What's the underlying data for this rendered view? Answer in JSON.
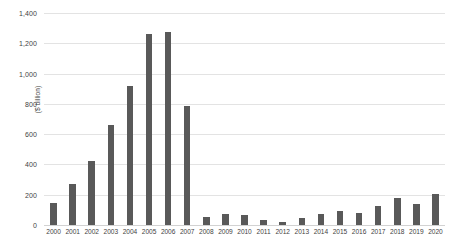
{
  "chart_data": {
    "type": "bar",
    "title": "",
    "subtitle": "",
    "xlabel": "",
    "ylabel": "($ billion)",
    "ylim": [
      0,
      1400
    ],
    "ytick_step": 200,
    "grid": true,
    "legend": false,
    "legend_position": "none",
    "bar_color": "#595959",
    "gridline_color": "#e3e3e3",
    "background_color": "#ffffff",
    "categories": [
      "2000",
      "2001",
      "2002",
      "2003",
      "2004",
      "2005",
      "2006",
      "2007",
      "2008",
      "2009",
      "2010",
      "2011",
      "2012",
      "2013",
      "2014",
      "2015",
      "2016",
      "2017",
      "2018",
      "2019",
      "2020"
    ],
    "values": [
      148,
      268,
      420,
      660,
      915,
      1260,
      1275,
      787,
      52,
      70,
      65,
      35,
      22,
      48,
      75,
      95,
      82,
      125,
      178,
      140,
      202
    ],
    "ytick_labels": [
      "0",
      "200",
      "400",
      "600",
      "800",
      "1,000",
      "1,200",
      "1,400"
    ],
    "ytick_values": [
      0,
      200,
      400,
      600,
      800,
      1000,
      1200,
      1400
    ]
  },
  "caption": {
    "partial_text": ""
  }
}
